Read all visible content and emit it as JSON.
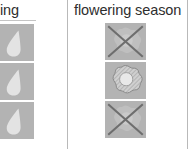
{
  "fragment": {
    "kind": "plant-care-reference-table-fragment",
    "visible_columns": 2
  },
  "columns": [
    {
      "id": "feeding",
      "header": "eding",
      "header_clipped": true,
      "icon_type": "water-drop-icon",
      "cells": [
        {
          "row": 1,
          "icon": "water-drop-icon",
          "crossed_out": false
        },
        {
          "row": 2,
          "icon": "water-drop-icon",
          "crossed_out": false
        },
        {
          "row": 3,
          "icon": "water-drop-icon",
          "crossed_out": false
        }
      ]
    },
    {
      "id": "flowering_season",
      "header": "flowering season",
      "header_clipped": false,
      "icon_type": "flower-icon",
      "cells": [
        {
          "row": 1,
          "icon": "flower-icon",
          "crossed_out": true
        },
        {
          "row": 2,
          "icon": "flower-icon",
          "crossed_out": false
        },
        {
          "row": 3,
          "icon": "flower-icon",
          "crossed_out": true
        }
      ]
    }
  ],
  "colors": {
    "tile_background": "#b3b3b3",
    "icon_fill": "#e3e3e3",
    "cross_mark": "#6e6e6e",
    "divider": "#b9b9b9",
    "header_text": "#2e2e2e",
    "page_background": "#ffffff"
  }
}
